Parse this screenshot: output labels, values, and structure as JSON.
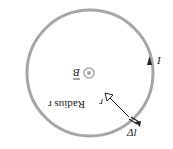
{
  "diagram": {
    "orientation": "rotated-180",
    "loop": {
      "label": "Radius r",
      "stroke_color": "#a6a6a6"
    },
    "field": {
      "label": "B",
      "symbol": "out-of-page dot",
      "color": "#a6a6a6"
    },
    "current": {
      "label": "I"
    },
    "element": {
      "label": "Δl"
    },
    "position_vector": {
      "label": "r"
    }
  }
}
